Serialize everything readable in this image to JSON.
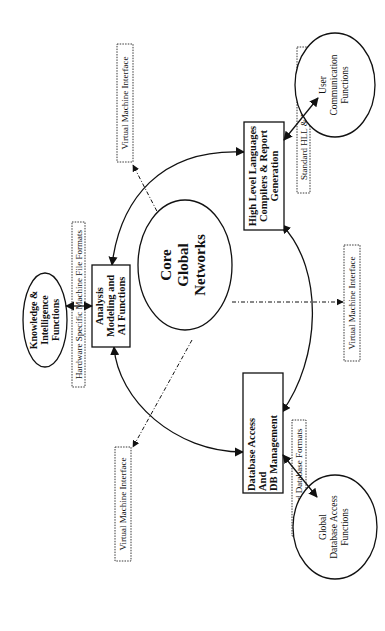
{
  "diagram": {
    "orientation": "rotated 90 degrees counter-clockwise",
    "core": {
      "lines": [
        "Core",
        "Global",
        "Networks"
      ]
    },
    "modules": {
      "analysis": {
        "lines": [
          "Analysis",
          "Modeling and",
          "AI Functions"
        ]
      },
      "hll": {
        "lines": [
          "High Level Languages",
          "Compilers & Report",
          "Generation"
        ]
      },
      "database": {
        "lines": [
          "Database Access",
          "And",
          "DB Management"
        ]
      }
    },
    "external_functions": {
      "knowledge": {
        "lines": [
          "Knowledge &",
          "Intelligence",
          "Functions"
        ]
      },
      "user_comm": {
        "lines": [
          "User",
          "Communication",
          "Functions"
        ]
      },
      "global_db": {
        "lines": [
          "Global",
          "Database Access",
          "Functions"
        ]
      }
    },
    "format_labels": {
      "hardware": "Hardware Specific Machine File Formats",
      "hll": "Standard HLL & HTML Formats",
      "database": "Standard Database Formats"
    },
    "interfaces": {
      "top": "Virtual Machine Interface",
      "bottom": "Virtual Machine Interface",
      "right": "Virtual Machine Interface"
    }
  }
}
